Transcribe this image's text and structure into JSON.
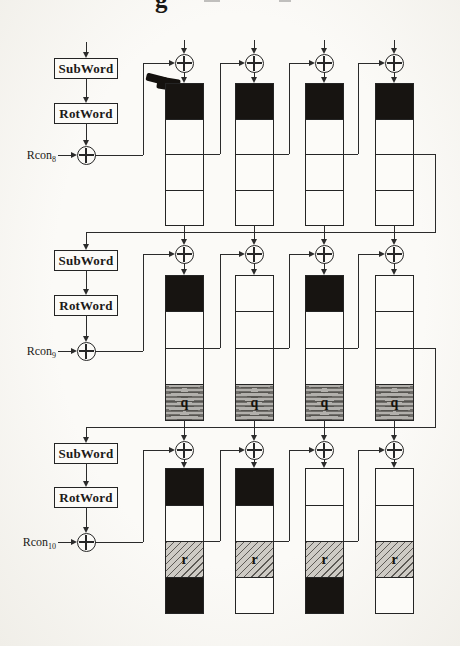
{
  "figure": {
    "caption_fragment": "g"
  },
  "ops": {
    "subword": "SubWord",
    "rotword": "RotWord",
    "rcon_base": "Rcon"
  },
  "rounds": [
    {
      "rcon_subscript": "8",
      "columns": [
        [
          "black",
          "white",
          "white",
          "white"
        ],
        [
          "black",
          "white",
          "white",
          "white"
        ],
        [
          "black",
          "white",
          "white",
          "white"
        ],
        [
          "black",
          "white",
          "white",
          "white"
        ]
      ]
    },
    {
      "rcon_subscript": "9",
      "columns": [
        [
          "black",
          "white",
          "white",
          "q"
        ],
        [
          "white",
          "white",
          "white",
          "q"
        ],
        [
          "black",
          "white",
          "white",
          "q"
        ],
        [
          "white",
          "white",
          "white",
          "q"
        ]
      ]
    },
    {
      "rcon_subscript": "10",
      "columns": [
        [
          "black",
          "white",
          "r",
          "black"
        ],
        [
          "black",
          "white",
          "r",
          "white"
        ],
        [
          "white",
          "white",
          "r",
          "black"
        ],
        [
          "white",
          "white",
          "r",
          "white"
        ]
      ]
    }
  ],
  "cell_labels": {
    "q": "q",
    "r": "r"
  },
  "colors": {
    "paper": "#fbfaf7",
    "ink": "#2b2b2b",
    "black_cell": "#171411",
    "q_fill": "#b2b0ac",
    "r_fill": "#cecbc5"
  }
}
